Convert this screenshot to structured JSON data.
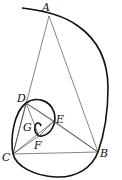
{
  "figure": {
    "type": "golden-spiral-construction",
    "points": [
      {
        "id": "A",
        "label": "A",
        "x": 49,
        "y": 16,
        "lx": 42,
        "ly": 11
      },
      {
        "id": "B",
        "label": "B",
        "x": 98,
        "y": 152,
        "lx": 100,
        "ly": 157
      },
      {
        "id": "C",
        "label": "C",
        "x": 13,
        "y": 154,
        "lx": 2,
        "ly": 161
      },
      {
        "id": "D",
        "label": "D",
        "x": 26,
        "y": 103,
        "lx": 17,
        "ly": 102
      },
      {
        "id": "E",
        "label": "E",
        "x": 54,
        "y": 121,
        "lx": 56,
        "ly": 123
      },
      {
        "id": "F",
        "label": "F",
        "x": 39,
        "y": 136,
        "lx": 34,
        "ly": 149
      },
      {
        "id": "G",
        "label": "G",
        "x": 36,
        "y": 124,
        "lx": 23,
        "ly": 131
      }
    ],
    "segments": [
      [
        "A",
        "B"
      ],
      [
        "A",
        "C"
      ],
      [
        "B",
        "C"
      ],
      [
        "B",
        "D"
      ],
      [
        "C",
        "D"
      ],
      [
        "D",
        "E"
      ],
      [
        "C",
        "E"
      ],
      [
        "D",
        "F"
      ],
      [
        "E",
        "F"
      ],
      [
        "C",
        "F"
      ],
      [
        "E",
        "B"
      ]
    ],
    "colors": {
      "stroke": "#111111",
      "thin": "#333333"
    }
  }
}
